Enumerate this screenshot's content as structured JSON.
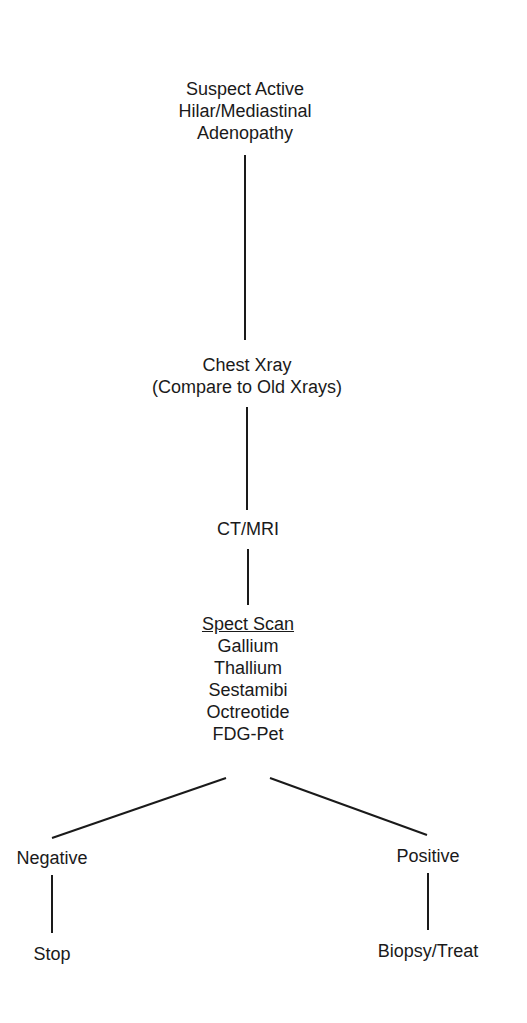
{
  "diagram": {
    "type": "flowchart",
    "nodes": {
      "start": {
        "lines": [
          "Suspect Active",
          "Hilar/Mediastinal",
          "Adenopathy"
        ]
      },
      "xray": {
        "lines": [
          "Chest Xray",
          "(Compare to Old Xrays)"
        ]
      },
      "ct": {
        "lines": [
          "CT/MRI"
        ]
      },
      "spect": {
        "heading": "Spect Scan",
        "lines": [
          "Gallium",
          "Thallium",
          "Sestamibi",
          "Octreotide",
          "FDG-Pet"
        ]
      },
      "negative": {
        "lines": [
          "Negative"
        ]
      },
      "positive": {
        "lines": [
          "Positive"
        ]
      },
      "stop": {
        "lines": [
          "Stop"
        ]
      },
      "biopsy": {
        "lines": [
          "Biopsy/Treat"
        ]
      }
    },
    "edges": [
      [
        "start",
        "xray"
      ],
      [
        "xray",
        "ct"
      ],
      [
        "ct",
        "spect"
      ],
      [
        "spect",
        "negative"
      ],
      [
        "spect",
        "positive"
      ],
      [
        "negative",
        "stop"
      ],
      [
        "positive",
        "biopsy"
      ]
    ],
    "colors": {
      "line": "#1a1a1a",
      "text": "#1a1a1a",
      "background": "#ffffff"
    }
  }
}
